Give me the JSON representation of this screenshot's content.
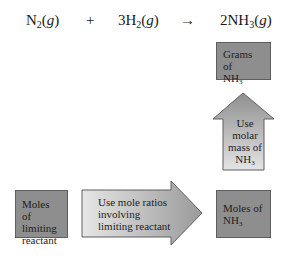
{
  "equation": {
    "reactant1": {
      "symbol": "N",
      "subscript": "2",
      "state": "g"
    },
    "plus": "+",
    "reactant2": {
      "coefficient": "3",
      "symbol": "H",
      "subscript": "2",
      "state": "g"
    },
    "arrow": "→",
    "product": {
      "coefficient": "2",
      "symbol": "NH",
      "subscript": "3",
      "state": "g"
    }
  },
  "nodes": {
    "grams_nh3": {
      "line1": "Grams of",
      "line2_symbol": "NH",
      "line2_sub": "3"
    },
    "moles_limiting": {
      "lines": [
        "Moles of",
        "limiting",
        "reactant"
      ]
    },
    "moles_nh3": {
      "line1": "Moles of",
      "line2_symbol": "NH",
      "line2_sub": "3"
    }
  },
  "arrows": {
    "up": {
      "lines": [
        "Use",
        "molar",
        "mass of"
      ],
      "last_symbol": "NH",
      "last_sub": "3",
      "direction": "up"
    },
    "right": {
      "lines": [
        "Use mole ratios",
        "involving",
        "limiting reactant"
      ],
      "direction": "right"
    }
  },
  "colors": {
    "box_fill": "#8e8e8e",
    "arrow_light": "#e2e2e2",
    "arrow_dark": "#9a9a9a",
    "border": "#5e5e5e"
  }
}
